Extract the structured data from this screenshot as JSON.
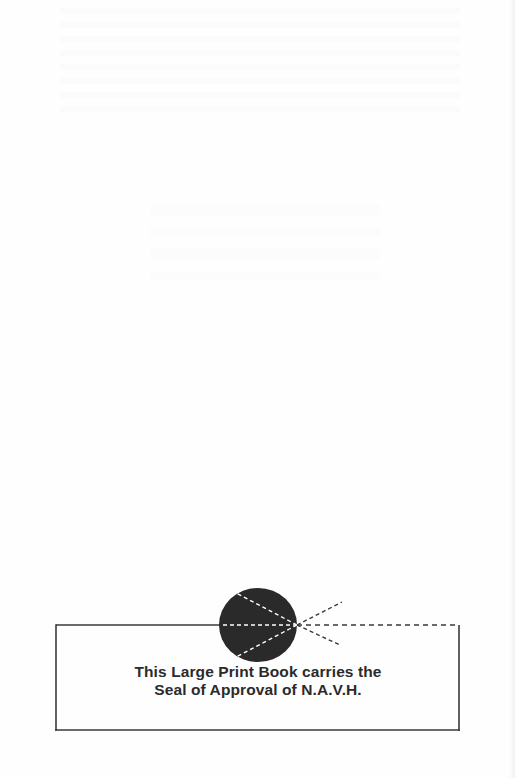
{
  "notice": {
    "line1": "This Large Print Book carries the",
    "line2": "Seal of Approval of N.A.V.H."
  },
  "seal": {
    "icon": "navh-seal-icon",
    "fill_color": "#2a2a2a"
  },
  "colors": {
    "text": "#2b2b2b",
    "border": "#3a3a3a",
    "background": "#fefefe"
  }
}
